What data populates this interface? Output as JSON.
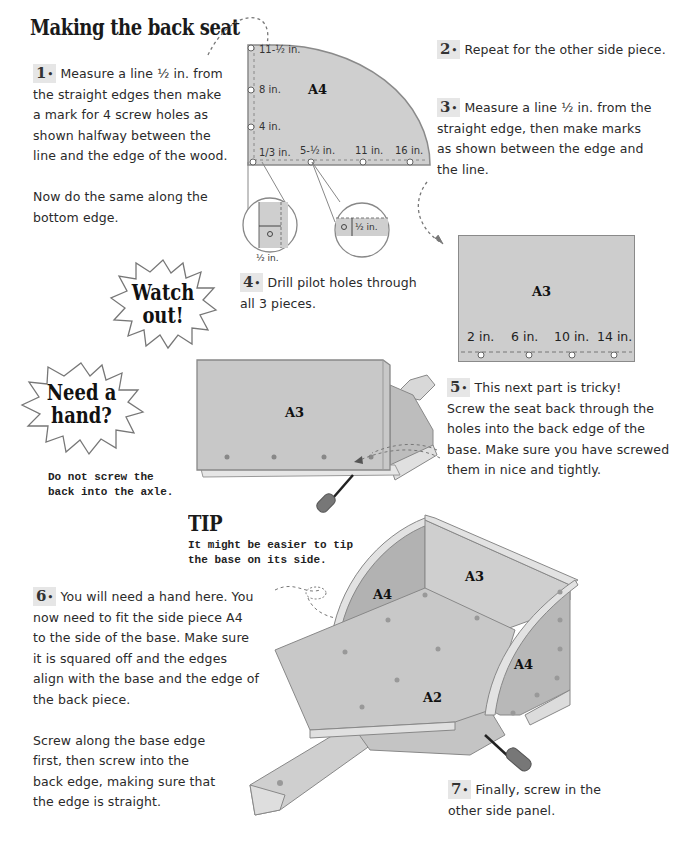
{
  "page": {
    "title": "Making the back seat"
  },
  "steps": [
    {
      "num": "1",
      "lines": [
        "Measure a line ½ in. from",
        "the straight edges then make",
        "a mark for 4 screw holes as",
        "shown halfway between the",
        "line and the edge of the wood."
      ],
      "extra": [
        "Now do the same along the",
        "bottom edge."
      ]
    },
    {
      "num": "2",
      "lines": [
        "Repeat for the other side piece."
      ]
    },
    {
      "num": "3",
      "lines": [
        "Measure a line ½ in. from the",
        "straight edge, then make marks",
        "as shown between the edge and",
        "the line."
      ]
    },
    {
      "num": "4",
      "lines": [
        "Drill pilot holes through",
        "all 3 pieces."
      ]
    },
    {
      "num": "5",
      "lines": [
        "This next part is tricky!",
        "Screw the seat back through the",
        "holes into the back edge of the",
        "base. Make sure you have screwed",
        "them in nice and tightly."
      ]
    },
    {
      "num": "6",
      "lines": [
        "You will need a hand here. You",
        "now need to fit the side piece A4",
        "to the side of the base. Make sure",
        "it is squared off and the edges",
        "align with the base and the edge of",
        "the back piece."
      ],
      "extra": [
        "Screw along the base edge",
        "first, then screw into the",
        "back edge, making sure that",
        "the edge is straight."
      ]
    },
    {
      "num": "7",
      "lines": [
        "Finally, screw in the",
        "other side panel."
      ]
    }
  ],
  "diagram_a4": {
    "label": "A4",
    "vertical_marks": [
      "11-½ in.",
      "8 in.",
      "4 in.",
      "1/3 in."
    ],
    "horizontal_marks": [
      "5-½ in.",
      "11 in.",
      "16 in."
    ],
    "detail_left_label": "½ in.",
    "detail_right_label": "½ in."
  },
  "diagram_a3": {
    "label": "A3",
    "marks": [
      "2 in.",
      "6 in.",
      "10 in.",
      "14 in."
    ]
  },
  "callouts": {
    "watch_out": [
      "Watch",
      "out!"
    ],
    "need_hand": [
      "Need a",
      "hand?"
    ],
    "need_hand_note": [
      "Do not screw the",
      "back into the axle."
    ]
  },
  "tip": {
    "heading": "TIP",
    "lines": [
      "It might be easier to tip",
      "the base on its side."
    ]
  },
  "assembly_step5": {
    "label": "A3"
  },
  "assembly_final": {
    "labels": {
      "left_side": "A4",
      "back": "A3",
      "base": "A2",
      "right_side": "A4"
    }
  },
  "colors": {
    "panel": "#c9c9c9",
    "panel_dark": "#a9a9a9",
    "panel_edge": "#e2e2e2",
    "outline": "#7a7a7a",
    "ink": "#222222"
  }
}
